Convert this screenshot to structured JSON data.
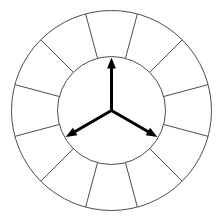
{
  "figure": {
    "title": "Segmented wheel with three radial vectors",
    "background_color": "#ffffff",
    "width": 223,
    "height": 222
  },
  "chart_data": {
    "type": "pie",
    "title": "Segmented wheel with three radial vectors",
    "subtitle": "",
    "xlabel": "",
    "ylabel": "",
    "legend_position": "none",
    "grid": false,
    "geometry": {
      "center_x": 111.5,
      "center_y": 110.5,
      "outer_radius": 100,
      "inner_radius": 54,
      "segment_count": 12,
      "segment_angle_deg": 30,
      "first_divider_angle_deg": 15,
      "stroke_color": "#4d4d4d",
      "stroke_width": 1,
      "fill_color": "#ffffff"
    },
    "categories": [
      "seg-1",
      "seg-2",
      "seg-3",
      "seg-4",
      "seg-5",
      "seg-6",
      "seg-7",
      "seg-8",
      "seg-9",
      "seg-10",
      "seg-11",
      "seg-12"
    ],
    "values": [
      30,
      30,
      30,
      30,
      30,
      30,
      30,
      30,
      30,
      30,
      30,
      30
    ],
    "segment_centers_deg": [
      90,
      60,
      30,
      0,
      330,
      300,
      270,
      240,
      210,
      180,
      150,
      120
    ],
    "divider_angles_deg": [
      15,
      45,
      75,
      105,
      135,
      165,
      195,
      225,
      255,
      285,
      315,
      345
    ],
    "annotations": [
      {
        "name": "arrow-up",
        "angle_deg": 90,
        "length": 53,
        "tip_x": 111.5,
        "tip_y": 57.5,
        "color": "#000000",
        "stroke_width": 3,
        "label": ""
      },
      {
        "name": "arrow-lower-left",
        "angle_deg": 210,
        "length": 53,
        "tip_x": 65.6,
        "tip_y": 137.0,
        "color": "#000000",
        "stroke_width": 3,
        "label": ""
      },
      {
        "name": "arrow-lower-right",
        "angle_deg": 330,
        "length": 53,
        "tip_x": 157.4,
        "tip_y": 137.0,
        "color": "#000000",
        "stroke_width": 3,
        "label": ""
      }
    ]
  },
  "accessibility": {
    "alt_text": "A circular ring divided into twelve equal segments, with three arrows of equal length radiating from the center at 120 degree intervals."
  }
}
